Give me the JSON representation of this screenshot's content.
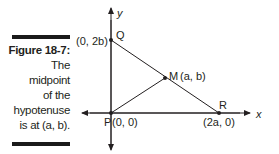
{
  "caption": {
    "figure_label": "Figure 18-7:",
    "lines": [
      "The",
      "midpoint",
      "of the",
      "hypotenuse",
      "is at (a, b)."
    ]
  },
  "diagram": {
    "axes": {
      "x_label": "x",
      "y_label": "y"
    },
    "points": {
      "P": {
        "name": "P",
        "coords": "(0, 0)"
      },
      "Q": {
        "name": "Q",
        "coords": "(0, 2b)"
      },
      "R": {
        "name": "R",
        "coords": "(2a, 0)"
      },
      "M": {
        "name": "M",
        "coords": "(a, b)"
      }
    },
    "segments": [
      "PQ",
      "QR",
      "PM"
    ],
    "colors": {
      "line": "#231f20",
      "bars": "#1a1a1a"
    }
  }
}
